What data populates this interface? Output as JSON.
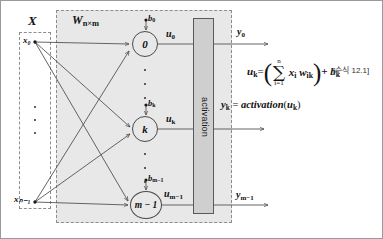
{
  "diagram": {
    "input_group": {
      "label": "X",
      "nodes": [
        "x₀",
        "xₙ₋₁"
      ],
      "ellipsis": "⋮"
    },
    "weight_group": {
      "label": "W",
      "label_sub": "n×m"
    },
    "neurons": [
      {
        "id": "neuron-0",
        "label": "0",
        "bias": "b",
        "bias_sub": "0",
        "output": "u",
        "output_sub": "0"
      },
      {
        "id": "neuron-k",
        "label": "k",
        "bias": "b",
        "bias_sub": "k",
        "output": "u",
        "output_sub": "k"
      },
      {
        "id": "neuron-m-1",
        "label": "m − 1",
        "bias": "b",
        "bias_sub": "m−1",
        "output": "u",
        "output_sub": "m−1"
      }
    ],
    "activation_block": {
      "label": "activation"
    },
    "outputs": [
      {
        "id": "output-y0",
        "label": "y",
        "sub": "0"
      },
      {
        "id": "output-ym-1",
        "label": "y",
        "sub": "m−1"
      }
    ],
    "formulas": {
      "eq1": {
        "lhs": "u",
        "lhs_sub": "k",
        "eq": "=",
        "sum_upper": "n",
        "sum_symbol": "∑",
        "sum_lower": "i=1",
        "body_x": "x",
        "body_x_sub": "i",
        "body_w": "w",
        "body_w_sub": "ik",
        "plus": "+ b",
        "plus_sub": "k",
        "paren_open": "(",
        "paren_close": ")",
        "reference": "[수식 12.1]"
      },
      "eq2": {
        "lhs": "y",
        "lhs_sub": "k",
        "eq": "=",
        "fn": "activation",
        "arg_open": "(",
        "arg": "u",
        "arg_sub": "k",
        "arg_close": ")"
      }
    },
    "colors": {
      "weight_region_bg": "#e8e8e8",
      "activation_bg": "#cfcfcf",
      "stroke": "#4a4a4a",
      "dashed_border": "#8d8d8d"
    }
  }
}
